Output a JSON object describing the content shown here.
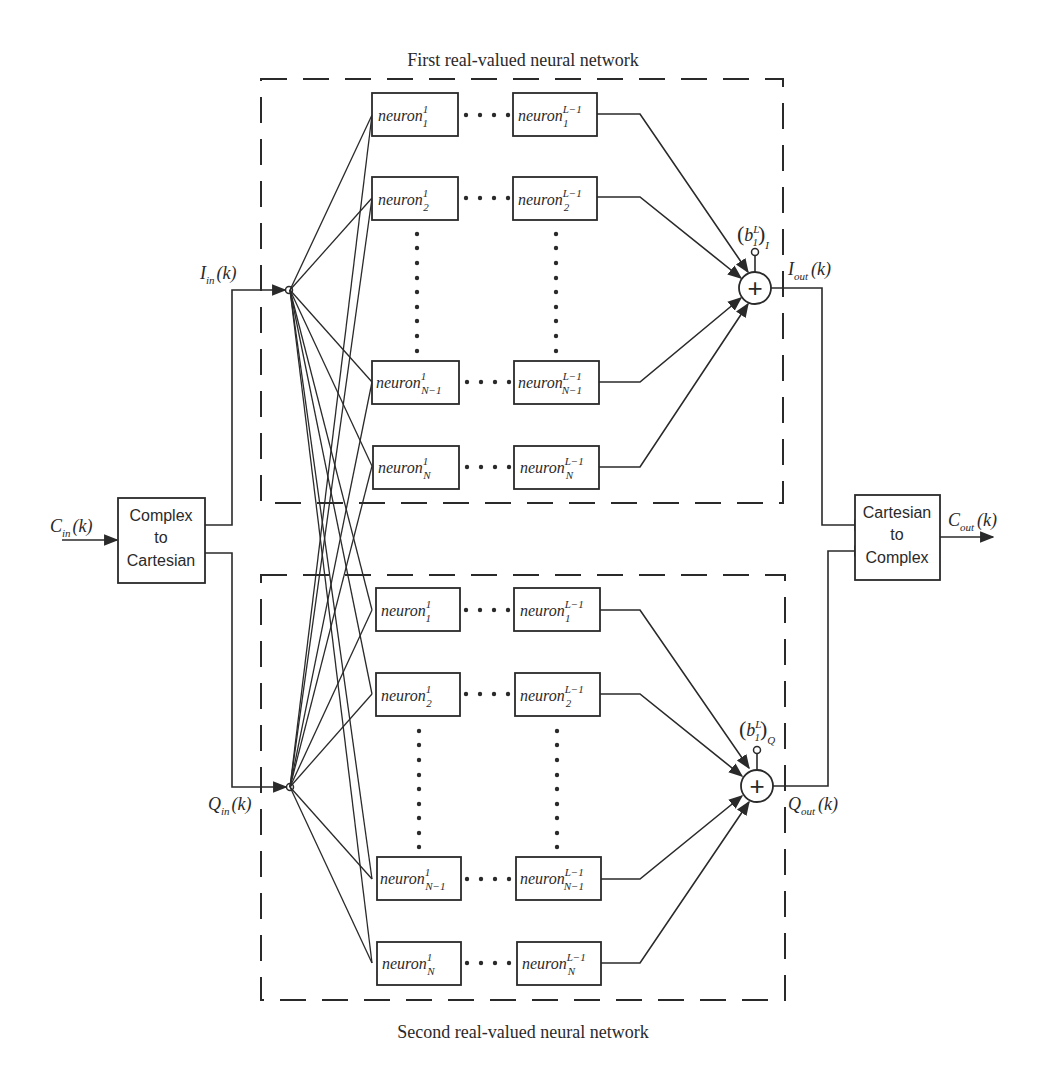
{
  "captions": {
    "top": "First real-valued neural network",
    "bottom": "Second real-valued neural network"
  },
  "blocks": {
    "complex_to_cartesian": [
      "Complex",
      "to",
      "Cartesian"
    ],
    "cartesian_to_complex": [
      "Cartesian",
      "to",
      "Complex"
    ]
  },
  "signals": {
    "c_in": {
      "base": "C",
      "sub": "in",
      "arg": "(k)"
    },
    "i_in": {
      "base": "I",
      "sub": "in",
      "arg": "(k)"
    },
    "q_in": {
      "base": "Q",
      "sub": "in",
      "arg": "(k)"
    },
    "i_out": {
      "base": "I",
      "sub": "out",
      "arg": "(k)"
    },
    "q_out": {
      "base": "Q",
      "sub": "out",
      "arg": "(k)"
    },
    "c_out": {
      "base": "C",
      "sub": "out",
      "arg": "(k)"
    }
  },
  "biases": {
    "i": {
      "base": "b",
      "sup": "L",
      "sub1": "1",
      "sub2": "I"
    },
    "q": {
      "base": "b",
      "sup": "L",
      "sub1": "1",
      "sub2": "Q"
    }
  },
  "neuron_label": "neuron",
  "networks": [
    {
      "id": "first",
      "rows": [
        {
          "first_sub": "1",
          "first_sup": "1",
          "last_sub": "1",
          "last_sup": "L−1"
        },
        {
          "first_sub": "2",
          "first_sup": "1",
          "last_sub": "2",
          "last_sup": "L−1"
        },
        {
          "first_sub": "N−1",
          "first_sup": "1",
          "last_sub": "N−1",
          "last_sup": "L−1"
        },
        {
          "first_sub": "N",
          "first_sup": "1",
          "last_sub": "N",
          "last_sup": "L−1"
        }
      ]
    },
    {
      "id": "second",
      "rows": [
        {
          "first_sub": "1",
          "first_sup": "1",
          "last_sub": "1",
          "last_sup": "L−1"
        },
        {
          "first_sub": "2",
          "first_sup": "1",
          "last_sub": "2",
          "last_sup": "L−1"
        },
        {
          "first_sub": "N−1",
          "first_sup": "1",
          "last_sub": "N−1",
          "last_sup": "L−1"
        },
        {
          "first_sub": "N",
          "first_sup": "1",
          "last_sub": "N",
          "last_sup": "L−1"
        }
      ]
    }
  ],
  "summer_symbol": "+",
  "colors": {
    "ink": "#2a2a2a",
    "background": "#ffffff"
  }
}
